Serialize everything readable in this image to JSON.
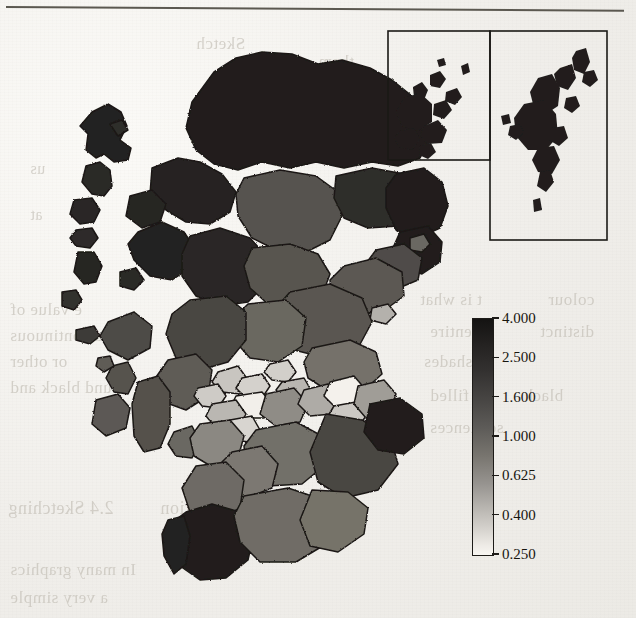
{
  "page": {
    "kind": "scanned-book-page-figure",
    "background_color": "#f2f0ec",
    "rule_color": "#5b5850"
  },
  "figure": {
    "map_outline_color": "#1b1916",
    "insets": [
      {
        "name": "orkney-inset",
        "label": "",
        "border_color": "#1b1916"
      },
      {
        "name": "shetland-inset",
        "label": "",
        "border_color": "#1b1916"
      }
    ]
  },
  "chart_data": {
    "type": "heatmap",
    "title": "",
    "subtitle": "",
    "xlabel": "",
    "ylabel": "",
    "legend_position": "right",
    "grid": false,
    "colorbar": {
      "orientation": "vertical",
      "scale": "log",
      "min": 0.25,
      "max": 4.0,
      "low_color": "#f8f6f2",
      "high_color": "#141312",
      "tick_labels": [
        "4.000",
        "2.500",
        "1.600",
        "1.000",
        "0.625",
        "0.400",
        "0.250"
      ],
      "tick_values": [
        4.0,
        2.5,
        1.6,
        1.0,
        0.625,
        0.4,
        0.25
      ]
    },
    "regions": [
      {
        "name": "Western Isles (Lewis & Harris)",
        "value": 3.6
      },
      {
        "name": "Western Isles (Uists)",
        "value": 3.4
      },
      {
        "name": "Highland (Sutherland)",
        "value": 3.8
      },
      {
        "name": "Highland (Caithness)",
        "value": 3.3
      },
      {
        "name": "Highland (Ross)",
        "value": 3.7
      },
      {
        "name": "Highland (Lochaber)",
        "value": 3.5
      },
      {
        "name": "Highland (Skye)",
        "value": 3.6
      },
      {
        "name": "Highland (Inverness)",
        "value": 2.4
      },
      {
        "name": "Moray",
        "value": 2.2
      },
      {
        "name": "Aberdeenshire (north)",
        "value": 3.2
      },
      {
        "name": "Aberdeenshire (east)",
        "value": 3.9
      },
      {
        "name": "Aberdeen City",
        "value": 1.5
      },
      {
        "name": "Angus",
        "value": 1.8
      },
      {
        "name": "Perth & Kinross",
        "value": 1.6
      },
      {
        "name": "Argyll & Bute (mainland)",
        "value": 2.6
      },
      {
        "name": "Argyll & Bute (islands)",
        "value": 1.7
      },
      {
        "name": "Stirling",
        "value": 1.5
      },
      {
        "name": "Clackmannanshire",
        "value": 0.55
      },
      {
        "name": "Falkirk",
        "value": 0.7
      },
      {
        "name": "Fife",
        "value": 1.4
      },
      {
        "name": "Dundee City",
        "value": 0.45
      },
      {
        "name": "West Dunbartonshire",
        "value": 0.5
      },
      {
        "name": "East Dunbartonshire",
        "value": 0.42
      },
      {
        "name": "Glasgow City",
        "value": 0.3
      },
      {
        "name": "Inverclyde",
        "value": 0.52
      },
      {
        "name": "Renfrewshire",
        "value": 0.6
      },
      {
        "name": "East Renfrewshire",
        "value": 0.45
      },
      {
        "name": "North Lanarkshire",
        "value": 0.9
      },
      {
        "name": "South Lanarkshire",
        "value": 1.5
      },
      {
        "name": "North Ayrshire",
        "value": 1.1
      },
      {
        "name": "East Ayrshire",
        "value": 1.3
      },
      {
        "name": "South Ayrshire",
        "value": 1.6
      },
      {
        "name": "West Lothian",
        "value": 0.75
      },
      {
        "name": "City of Edinburgh",
        "value": 0.28
      },
      {
        "name": "Midlothian",
        "value": 0.62
      },
      {
        "name": "East Lothian",
        "value": 0.85
      },
      {
        "name": "Scottish Borders",
        "value": 1.9
      },
      {
        "name": "Dumfries & Galloway (east)",
        "value": 1.7
      },
      {
        "name": "Dumfries & Galloway (west)",
        "value": 3.4
      },
      {
        "name": "Orkney Islands",
        "value": 3.9
      },
      {
        "name": "Shetland Islands",
        "value": 3.9
      }
    ]
  },
  "ghost_text": {
    "note": "faint mirrored show-through text from the reverse side of the scanned page",
    "lines": [
      {
        "text": "Sketch",
        "x": 196,
        "y": 34,
        "size": 17,
        "mirror": true
      },
      {
        "text": "them",
        "x": 318,
        "y": 52,
        "size": 17,
        "mirror": true
      },
      {
        "text": "Colour",
        "x": 206,
        "y": 96,
        "size": 17,
        "mirror": true
      },
      {
        "text": "us",
        "x": 30,
        "y": 160,
        "size": 16,
        "mirror": true
      },
      {
        "text": "at",
        "x": 30,
        "y": 206,
        "size": 16,
        "mirror": true
      },
      {
        "text": "e value of",
        "x": 10,
        "y": 300,
        "size": 17,
        "mirror": true
      },
      {
        "text": "is a continuous",
        "x": 10,
        "y": 326,
        "size": 17,
        "mirror": true
      },
      {
        "text": "or other",
        "x": 10,
        "y": 352,
        "size": 17,
        "mirror": true
      },
      {
        "text": "round black and",
        "x": 10,
        "y": 378,
        "size": 17,
        "mirror": true
      },
      {
        "text": "2.4 Sketching",
        "x": 8,
        "y": 498,
        "size": 18,
        "mirror": true
      },
      {
        "text": "monstration",
        "x": 160,
        "y": 498,
        "size": 18,
        "mirror": true
      },
      {
        "text": "In many graphics",
        "x": 10,
        "y": 560,
        "size": 17,
        "mirror": true
      },
      {
        "text": "a very simple",
        "x": 10,
        "y": 588,
        "size": 17,
        "mirror": true
      },
      {
        "text": "t is what",
        "x": 420,
        "y": 290,
        "size": 17,
        "mirror": true
      },
      {
        "text": "colour",
        "x": 548,
        "y": 290,
        "size": 17,
        "mirror": true
      },
      {
        "text": "entire",
        "x": 430,
        "y": 322,
        "size": 17,
        "mirror": true
      },
      {
        "text": "distinct",
        "x": 540,
        "y": 322,
        "size": 17,
        "mirror": true
      },
      {
        "text": "shades",
        "x": 424,
        "y": 352,
        "size": 17,
        "mirror": true
      },
      {
        "text": "filled",
        "x": 430,
        "y": 386,
        "size": 17,
        "mirror": true
      },
      {
        "text": "black",
        "x": 524,
        "y": 386,
        "size": 17,
        "mirror": true
      },
      {
        "text": "sequences",
        "x": 430,
        "y": 418,
        "size": 17,
        "mirror": true
      }
    ]
  }
}
